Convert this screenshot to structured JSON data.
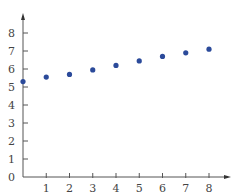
{
  "chart_data": {
    "type": "scatter",
    "title": "",
    "xlabel": "",
    "ylabel": "",
    "xlim": [
      0,
      8
    ],
    "ylim": [
      0,
      8
    ],
    "x_ticks": [
      1,
      2,
      3,
      4,
      5,
      6,
      7,
      8
    ],
    "y_ticks": [
      0,
      1,
      2,
      3,
      4,
      5,
      6,
      7,
      8
    ],
    "grid": false,
    "legend": null,
    "series": [
      {
        "name": "points",
        "color": "#2b4a9a",
        "x": [
          0,
          1,
          2,
          3,
          4,
          5,
          6,
          7,
          8
        ],
        "y": [
          5.3,
          5.55,
          5.7,
          5.95,
          6.2,
          6.45,
          6.7,
          6.9,
          7.1
        ]
      }
    ]
  },
  "colors": {
    "axis": "#555555",
    "point": "#2b4a9a",
    "text": "#444444"
  }
}
